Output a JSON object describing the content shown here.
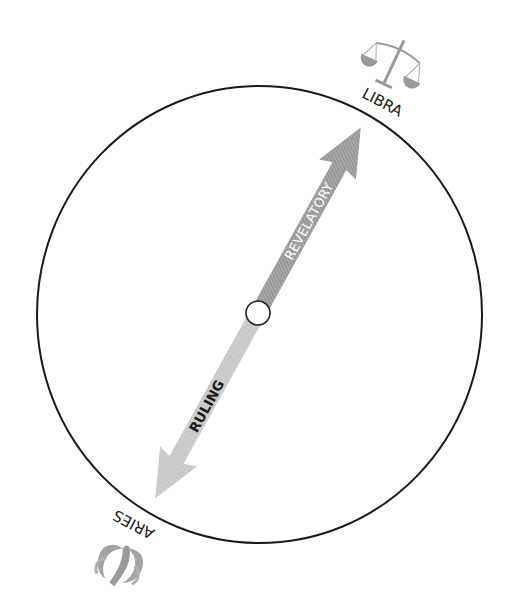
{
  "diagram": {
    "type": "zodiac-axis",
    "labels": {
      "top_sign": "LIBRA",
      "bottom_sign": "ARIES",
      "upper_arrow": "REVELATORY",
      "lower_arrow": "RULING"
    },
    "icons": {
      "top_sign_icon": "libra-scales-icon",
      "bottom_sign_icon": "aries-ram-icon"
    },
    "colors": {
      "circle_stroke": "#1a1a1a",
      "upper_arrow_fill": "#9c9c9c",
      "lower_arrow_fill": "#c9c9c9",
      "icon_fill": "#9a9a9a",
      "upper_text": "#ffffff",
      "lower_text": "#1a1a1a"
    }
  }
}
